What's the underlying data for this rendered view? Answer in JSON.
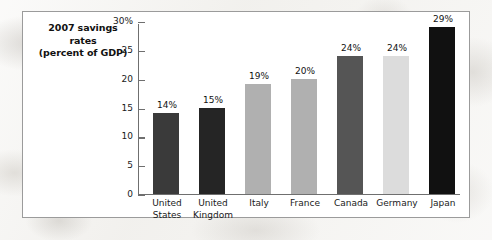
{
  "chart_data": {
    "type": "bar",
    "title": "2007 savings rates (percent of GDP)",
    "title_lines": [
      "2007 savings",
      "rates",
      "(percent of GDP)"
    ],
    "xlabel": "",
    "ylabel": "",
    "ylim": [
      0,
      30
    ],
    "grid": false,
    "legend": "none",
    "y_ticks": [
      {
        "label": "30%",
        "value": 30
      },
      {
        "label": "25",
        "value": 25
      },
      {
        "label": "20",
        "value": 20
      },
      {
        "label": "15",
        "value": 15
      },
      {
        "label": "10",
        "value": 10
      },
      {
        "label": "5",
        "value": 5
      },
      {
        "label": "0",
        "value": 0
      }
    ],
    "categories": [
      "United States",
      "United Kingdom",
      "Italy",
      "France",
      "Canada",
      "Germany",
      "Japan"
    ],
    "category_lines": [
      [
        "United",
        "States"
      ],
      [
        "United",
        "Kingdom"
      ],
      [
        "Italy",
        ""
      ],
      [
        "France",
        ""
      ],
      [
        "Canada",
        ""
      ],
      [
        "Germany",
        ""
      ],
      [
        "Japan",
        ""
      ]
    ],
    "values": [
      14,
      15,
      19,
      20,
      24,
      24,
      29
    ],
    "data_labels": [
      "14%",
      "15%",
      "19%",
      "20%",
      "24%",
      "24%",
      "29%"
    ],
    "bar_colors": [
      "#3a3a3a",
      "#252525",
      "#b0b0b0",
      "#b0b0b0",
      "#555555",
      "#dcdcdc",
      "#111111"
    ]
  },
  "colors": {
    "panel_background": "#ffffff",
    "panel_border": "#9b9b9b",
    "page_background": "#f3f2ef",
    "axis": "#6f6f6f",
    "text": "#111111"
  }
}
